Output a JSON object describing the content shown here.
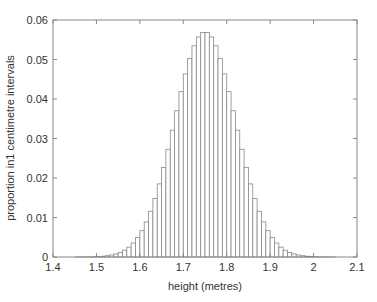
{
  "chart_data": {
    "type": "bar",
    "title": "",
    "xlabel": "height (metres)",
    "ylabel": "proportion in1 centimetre intervals",
    "xlim": [
      1.4,
      2.1
    ],
    "ylim": [
      0,
      0.06
    ],
    "xticks": [
      "1.4",
      "1.5",
      "1.6",
      "1.7",
      "1.8",
      "1.9",
      "2",
      "2.1"
    ],
    "yticks": [
      "0",
      "0.01",
      "0.02",
      "0.03",
      "0.04",
      "0.05",
      "0.06"
    ],
    "grid": false,
    "legend": null,
    "bin_width": 0.01,
    "distribution": {
      "name": "normal",
      "mean": 1.75,
      "sd": 0.07
    },
    "bin_start": 1.45,
    "bin_end": 2.05,
    "bar_fill": "#ffffff",
    "bar_edge": "#888888"
  }
}
